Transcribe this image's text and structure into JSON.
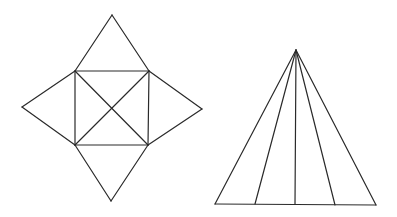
{
  "figures": {
    "pyramid_net": {
      "label": "square pyramid net",
      "square": {
        "tl": [
          75,
          71
        ],
        "tr": [
          149,
          71
        ],
        "br": [
          148,
          145
        ],
        "bl": [
          75,
          145
        ]
      },
      "apexes": {
        "top": [
          112,
          15
        ],
        "right": [
          202,
          109
        ],
        "bottom": [
          111,
          201
        ],
        "left": [
          22,
          107
        ]
      },
      "diagonals": true
    },
    "triangle_fan": {
      "label": "triangle subdivided into four triangles",
      "apex": [
        296,
        50
      ],
      "base_points": [
        [
          215,
          204
        ],
        [
          255,
          204
        ],
        [
          295,
          204
        ],
        [
          335,
          205
        ],
        [
          376,
          205
        ]
      ]
    }
  },
  "colors": {
    "stroke": "#2a2a2a",
    "background": "#ffffff"
  }
}
